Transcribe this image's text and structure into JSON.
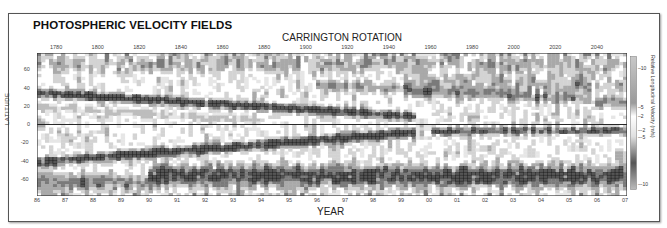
{
  "title": "PHOTOSPHERIC VELOCITY FIELDS",
  "chart_data": {
    "type": "heatmap",
    "title": "PHOTOSPHERIC VELOCITY FIELDS",
    "top_xlabel": "CARRINGTON ROTATION",
    "xlabel": "YEAR",
    "ylabel": "LATITUDE",
    "colorbar_label": "Relative Longitudinal Velocity (m/s)",
    "colorbar_ticks": [
      "10",
      "5",
      "2",
      "-2",
      "-5",
      "-10"
    ],
    "colorbar_range": [
      -12,
      12
    ],
    "ylim": [
      -72,
      72
    ],
    "yticks": [
      "60",
      "40",
      "20",
      "0",
      "-20",
      "-40",
      "-60"
    ],
    "x_year_ticks": [
      "86",
      "87",
      "88",
      "89",
      "90",
      "91",
      "92",
      "93",
      "94",
      "95",
      "96",
      "97",
      "98",
      "99",
      "00",
      "01",
      "02",
      "03",
      "04",
      "05",
      "06",
      "07"
    ],
    "x_carrington_ticks": [
      "1780",
      "1800",
      "1820",
      "1840",
      "1860",
      "1880",
      "1900",
      "1920",
      "1940",
      "1960",
      "1980",
      "2000",
      "2020",
      "2040"
    ],
    "equator_line": 0,
    "grid": false,
    "features": [
      {
        "name": "torsional oscillation band (north, fast)",
        "start_year": 1986,
        "start_lat": 32,
        "end_year": 1999.5,
        "end_lat": 8
      },
      {
        "name": "torsional oscillation band (south, fast)",
        "start_year": 1986,
        "start_lat": -38,
        "end_year": 1999.5,
        "end_lat": -8
      },
      {
        "name": "new cycle band (north)",
        "start_year": 1996,
        "start_lat": 40,
        "end_year": 2007,
        "end_lat": 20
      },
      {
        "name": "equatorial band (cycle 23 south)",
        "start_year": 2000,
        "start_lat": -8,
        "end_year": 2007,
        "end_lat": -6
      },
      {
        "name": "high-latitude south fast flow",
        "start_year": 1990,
        "start_lat": -50,
        "end_year": 2007,
        "end_lat": -50
      }
    ]
  },
  "labels": {
    "top_axis": "CARRINGTON ROTATION",
    "bottom_axis": "YEAR",
    "y_axis": "LATITUDE",
    "colorbar": "Relative Longitudinal Velocity (m/s)"
  }
}
